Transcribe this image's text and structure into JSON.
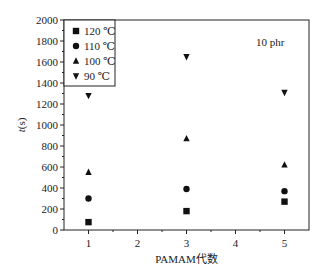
{
  "chart_data": {
    "type": "scatter",
    "title": "",
    "annotation": "10 phr",
    "xlabel": "PAMAM代数",
    "ylabel": "t(s)",
    "xlim": [
      0.5,
      5.5
    ],
    "ylim": [
      0,
      2000
    ],
    "x_ticks": [
      1,
      2,
      3,
      4,
      5
    ],
    "y_ticks": [
      0,
      200,
      400,
      600,
      800,
      1000,
      1200,
      1400,
      1600,
      1800,
      2000
    ],
    "grid": false,
    "legend_position": "top-left (inside)",
    "x": [
      1,
      3,
      5
    ],
    "series": [
      {
        "name": "120 ℃",
        "marker": "square",
        "values": [
          75,
          180,
          270
        ]
      },
      {
        "name": "110 ℃",
        "marker": "circle",
        "values": [
          300,
          390,
          370
        ]
      },
      {
        "name": "100 ℃",
        "marker": "triangle-up",
        "values": [
          550,
          870,
          620
        ]
      },
      {
        "name": "90 ℃",
        "marker": "triangle-down",
        "values": [
          1280,
          1650,
          1310
        ]
      }
    ]
  }
}
